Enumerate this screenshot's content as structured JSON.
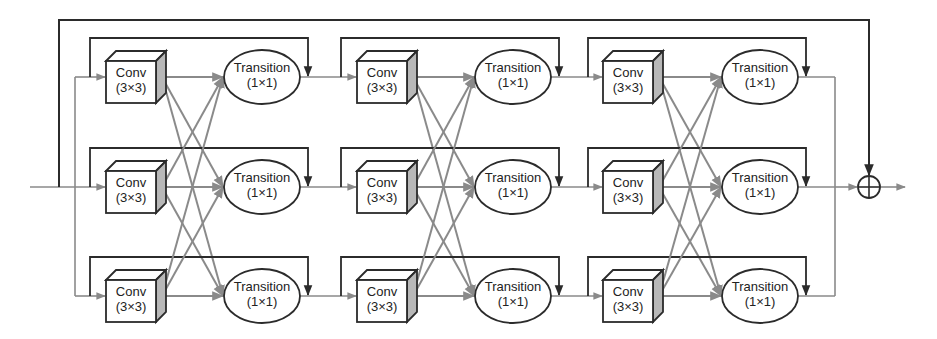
{
  "diagram": {
    "title": "",
    "node_types": {
      "conv": {
        "line1": "Conv",
        "line2": "(3×3)"
      },
      "transition": {
        "line1": "Transition",
        "line2": "(1×1)"
      }
    },
    "rows_y": [
      77,
      187,
      296
    ],
    "blocks": [
      {
        "id": "block-1",
        "conv_x": 106,
        "trans_cx": 262,
        "skip_start_x": 90,
        "skip_end_x": 308
      },
      {
        "id": "block-2",
        "conv_x": 357,
        "trans_cx": 513,
        "skip_start_x": 341,
        "skip_end_x": 559
      },
      {
        "id": "block-3",
        "conv_x": 603,
        "trans_cx": 760,
        "skip_start_x": 588,
        "skip_end_x": 806
      }
    ],
    "merge_x": 835,
    "sum_node": {
      "symbol": "⊕",
      "cx": 869,
      "cy": 187,
      "r": 11
    },
    "global_skip": {
      "x_start": 59,
      "x_end": 869,
      "y_top": 20
    },
    "colors": {
      "stroke_dark": "#2b2b2b",
      "stroke_gray": "#8a8a8a",
      "side_face": "#b8b8b8",
      "fill": "#ffffff"
    }
  }
}
